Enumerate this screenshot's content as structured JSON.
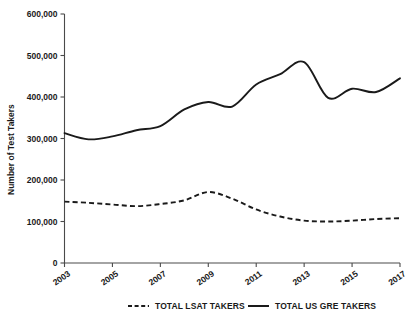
{
  "chart_data": {
    "type": "line",
    "title": "",
    "xlabel": "",
    "ylabel": "Number of Test Takers",
    "xlim": [
      2003,
      2017
    ],
    "ylim": [
      0,
      600000
    ],
    "grid": false,
    "legend_position": "bottom",
    "x": [
      2003,
      2004,
      2005,
      2006,
      2007,
      2008,
      2009,
      2010,
      2011,
      2012,
      2013,
      2014,
      2015,
      2016,
      2017
    ],
    "y_ticks": [
      0,
      100000,
      200000,
      300000,
      400000,
      500000,
      600000
    ],
    "y_tick_labels": [
      "0",
      "100,000",
      "200,000",
      "300,000",
      "400,000",
      "500,000",
      "600,000"
    ],
    "x_ticks": [
      2003,
      2005,
      2007,
      2009,
      2011,
      2013,
      2015,
      2017
    ],
    "x_tick_labels": [
      "2003",
      "2005",
      "2007",
      "2009",
      "2011",
      "2013",
      "2015",
      "2017"
    ],
    "series": [
      {
        "name": "TOTAL LSAT TAKERS",
        "style": "dashed",
        "color": "#1a1a1a",
        "values": [
          148000,
          145000,
          141000,
          137000,
          142000,
          151000,
          171000,
          155000,
          129000,
          112000,
          102000,
          100000,
          102000,
          106000,
          108000
        ]
      },
      {
        "name": "TOTAL US GRE TAKERS",
        "style": "solid",
        "color": "#1a1a1a",
        "values": [
          313000,
          298000,
          305000,
          320000,
          330000,
          370000,
          388000,
          377000,
          430000,
          455000,
          484000,
          398000,
          420000,
          412000,
          445000
        ]
      }
    ]
  },
  "legend": {
    "items": [
      {
        "label": "TOTAL LSAT TAKERS",
        "style": "dashed"
      },
      {
        "label": "TOTAL US GRE TAKERS",
        "style": "solid"
      }
    ]
  },
  "axes": {
    "y_axis_title": "Number of Test Takers"
  }
}
